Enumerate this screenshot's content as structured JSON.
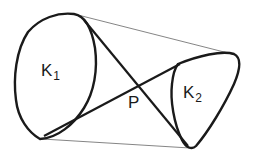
{
  "diagram": {
    "labels": {
      "k1": {
        "main": "K",
        "sub": "1"
      },
      "k2": {
        "main": "K",
        "sub": "2"
      },
      "p": "P"
    },
    "colors": {
      "stroke": "#1a1a1a",
      "thin": "#555555",
      "background": "#ffffff"
    }
  }
}
